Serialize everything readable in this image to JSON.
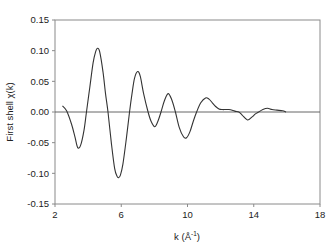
{
  "chart_data": {
    "type": "line",
    "title": "",
    "xlabel": "k (Å⁻¹)",
    "xlabel_main": "k (Å",
    "xlabel_sup": "-1",
    "xlabel_close": ")",
    "ylabel": "First shell χ(k)",
    "xlim": [
      2,
      18
    ],
    "ylim": [
      -0.15,
      0.15
    ],
    "x_ticks": [
      2,
      6,
      10,
      14,
      18
    ],
    "x_tick_labels": [
      "2",
      "6",
      "10",
      "14",
      "18"
    ],
    "y_ticks": [
      0.15,
      0.1,
      0.05,
      0.0,
      -0.05,
      -0.1,
      -0.15
    ],
    "y_tick_labels": [
      "0.15",
      "0.10",
      "0.05",
      "0.00",
      "-0.05",
      "-0.10",
      "-0.15"
    ],
    "grid": false,
    "zero_line": true,
    "legend": null,
    "series": [
      {
        "name": "First shell χ(k)",
        "color": "#333333",
        "x": [
          2.45,
          2.7,
          3.0,
          3.2,
          3.37,
          3.55,
          3.75,
          3.9,
          4.1,
          4.3,
          4.45,
          4.57,
          4.7,
          4.9,
          5.05,
          5.2,
          5.4,
          5.6,
          5.75,
          5.84,
          5.95,
          6.1,
          6.3,
          6.5,
          6.65,
          6.8,
          6.99,
          7.15,
          7.35,
          7.62,
          7.8,
          8.02,
          8.2,
          8.4,
          8.6,
          8.83,
          9.05,
          9.27,
          9.5,
          9.75,
          9.94,
          10.15,
          10.35,
          10.55,
          10.8,
          11.09,
          11.3,
          11.5,
          11.7,
          11.9,
          12.1,
          12.3,
          12.5,
          12.7,
          12.9,
          13.1,
          13.3,
          13.62,
          13.9,
          14.1,
          14.3,
          14.55,
          14.83,
          15.1,
          15.4,
          15.74,
          15.95
        ],
        "y": [
          0.01,
          0.002,
          -0.02,
          -0.04,
          -0.058,
          -0.054,
          -0.03,
          0.0,
          0.04,
          0.08,
          0.098,
          0.104,
          0.098,
          0.065,
          0.03,
          0.0,
          -0.05,
          -0.092,
          -0.105,
          -0.107,
          -0.103,
          -0.085,
          -0.045,
          0.0,
          0.03,
          0.055,
          0.066,
          0.058,
          0.03,
          0.0,
          -0.015,
          -0.024,
          -0.016,
          0.0,
          0.018,
          0.03,
          0.02,
          0.0,
          -0.025,
          -0.04,
          -0.042,
          -0.032,
          -0.015,
          0.0,
          0.015,
          0.023,
          0.021,
          0.015,
          0.009,
          0.005,
          0.004,
          0.004,
          0.004,
          0.003,
          0.001,
          0.0,
          -0.005,
          -0.013,
          -0.008,
          -0.003,
          0.0,
          0.004,
          0.006,
          0.004,
          0.003,
          0.002,
          0.0
        ]
      }
    ]
  }
}
